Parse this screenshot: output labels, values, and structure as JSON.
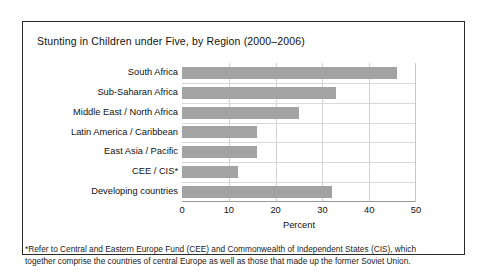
{
  "figure": {
    "title": "Stunting in Children under Five, by Region (2000–2006)",
    "footnote_line1": "*Refer to Central and Eastern Europe Fund (CEE) and Commonwealth of Independent States (CIS), which",
    "footnote_line2": "together comprise the countries of central Europe as well as those that made up the former Soviet Union.",
    "border_color": "#2b2b2b",
    "bar_color": "#a3a3a3",
    "grid_color": "#d2d2d2"
  },
  "chart_data": {
    "type": "bar",
    "orientation": "horizontal",
    "title": "Stunting in Children under Five, by Region (2000–2006)",
    "xlabel": "Percent",
    "ylabel": "",
    "xlim": [
      0,
      50
    ],
    "xticks": [
      0,
      10,
      20,
      30,
      40,
      50
    ],
    "xticklabels": [
      "0",
      "10",
      "20",
      "30",
      "40",
      "50"
    ],
    "grid": true,
    "legend": false,
    "categories": [
      "South Africa",
      "Sub-Saharan Africa",
      "Middle East / North Africa",
      "Latin America / Caribbean",
      "East Asia / Pacific",
      "CEE / CIS*",
      "Developing countries"
    ],
    "values": [
      46,
      33,
      25,
      16,
      16,
      12,
      32
    ]
  }
}
